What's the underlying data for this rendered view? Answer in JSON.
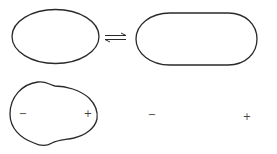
{
  "diagram": {
    "rows": [
      {
        "name": "neutral",
        "left_shape": "ellipse",
        "relation": "equilibrium",
        "right_shape": "elongated-ellipse"
      },
      {
        "name": "polarized",
        "left_shape": "lobed-ellipse",
        "relation": "equilibrium",
        "right_shape": "elongated-lobed-ellipse",
        "left_labels": {
          "minus": "−",
          "plus": "+"
        },
        "right_labels": {
          "minus": "−",
          "plus": "+"
        }
      }
    ],
    "colors": {
      "stroke": "#2a2a2a",
      "background": "#ffffff"
    }
  }
}
